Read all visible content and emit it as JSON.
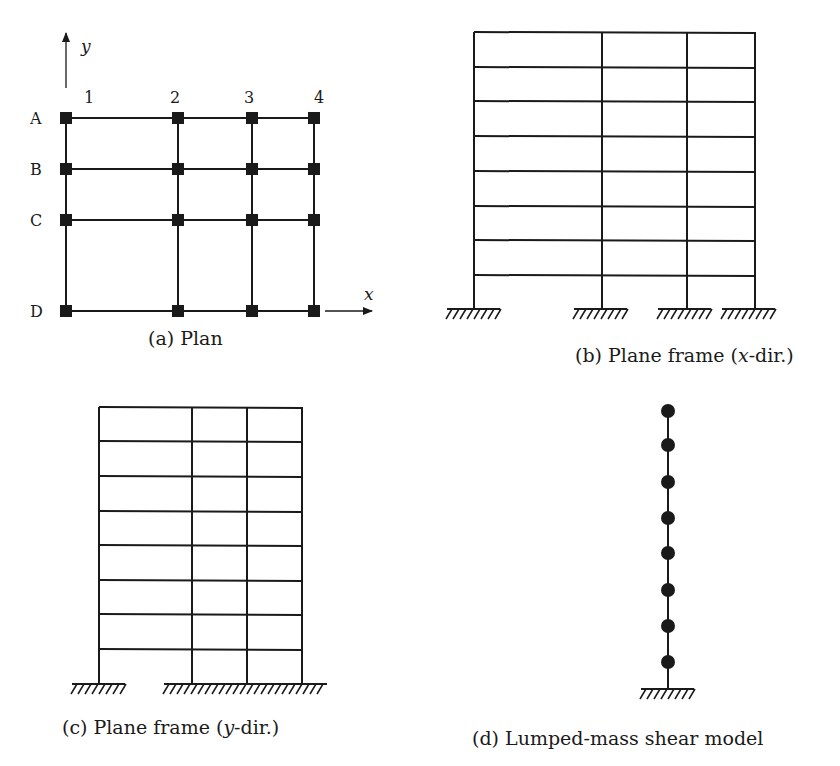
{
  "figure": {
    "panels": [
      {
        "id": "a",
        "caption": "(a) Plan",
        "axis_labels": {
          "y": "y",
          "x": "x"
        },
        "column_labels": [
          "1",
          "2",
          "3",
          "4"
        ],
        "row_labels": [
          "A",
          "B",
          "C",
          "D"
        ],
        "column_x": [
          66,
          178,
          252,
          314
        ],
        "row_y": [
          118,
          169,
          220,
          311
        ]
      },
      {
        "id": "b",
        "caption_prefix": "(b) Plane frame (",
        "caption_var": "x",
        "caption_suffix": "-dir.)",
        "stories": 8,
        "bays": 3,
        "column_x": [
          474,
          602,
          687,
          755
        ],
        "level_y": [
          32,
          67,
          101,
          136,
          171,
          206,
          240,
          275,
          309
        ]
      },
      {
        "id": "c",
        "caption_prefix": "(c) Plane frame (",
        "caption_var": "y",
        "caption_suffix": "-dir.)",
        "stories": 8,
        "bays": 3,
        "column_x": [
          99,
          192,
          247,
          302
        ],
        "level_y": [
          407,
          441,
          476,
          511,
          545,
          580,
          614,
          649,
          684
        ]
      },
      {
        "id": "d",
        "caption": "(d) Lumped-mass shear model",
        "masses": 8,
        "stick_x": 668,
        "mass_y": [
          411,
          445,
          482,
          518,
          553,
          590,
          626,
          662
        ],
        "ground_y": 689
      }
    ],
    "colors": {
      "line": "#1a1a1a",
      "background": "#ffffff"
    }
  }
}
